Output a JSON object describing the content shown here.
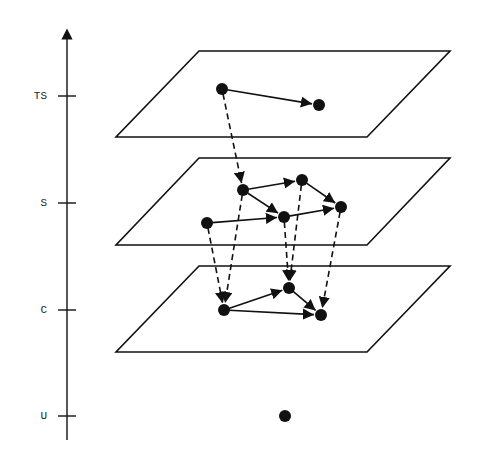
{
  "axis": {
    "x": 67,
    "top": 30,
    "bottom": 440,
    "levels": [
      {
        "id": "TS",
        "label": "TS",
        "y": 96
      },
      {
        "id": "S",
        "label": "S",
        "y": 203
      },
      {
        "id": "C",
        "label": "C",
        "y": 310
      },
      {
        "id": "U",
        "label": "U",
        "y": 416
      }
    ]
  },
  "planes": [
    {
      "id": "TS",
      "top_y": 51,
      "bottom_y": 137,
      "top_x1": 199,
      "top_x2": 450,
      "bottom_x1": 116,
      "bottom_x2": 367
    },
    {
      "id": "S",
      "top_y": 158,
      "bottom_y": 245,
      "top_x1": 199,
      "top_x2": 450,
      "bottom_x1": 116,
      "bottom_x2": 367
    },
    {
      "id": "C",
      "top_y": 266,
      "bottom_y": 352,
      "top_x1": 199,
      "top_x2": 450,
      "bottom_x1": 116,
      "bottom_x2": 367
    }
  ],
  "nodes": [
    {
      "id": "ts1",
      "level": "TS",
      "x": 222,
      "y": 89
    },
    {
      "id": "ts2",
      "level": "TS",
      "x": 319,
      "y": 105
    },
    {
      "id": "s1",
      "level": "S",
      "x": 243,
      "y": 190
    },
    {
      "id": "s2",
      "level": "S",
      "x": 302,
      "y": 180
    },
    {
      "id": "s3",
      "level": "S",
      "x": 341,
      "y": 207
    },
    {
      "id": "s4",
      "level": "S",
      "x": 284,
      "y": 217
    },
    {
      "id": "s5",
      "level": "S",
      "x": 207,
      "y": 223
    },
    {
      "id": "c1",
      "level": "C",
      "x": 224,
      "y": 310
    },
    {
      "id": "c2",
      "level": "C",
      "x": 289,
      "y": 288
    },
    {
      "id": "c3",
      "level": "C",
      "x": 321,
      "y": 315
    },
    {
      "id": "u1",
      "level": "U",
      "x": 285,
      "y": 416
    }
  ],
  "edges": [
    {
      "from": "ts1",
      "to": "ts2",
      "style": "solid"
    },
    {
      "from": "s1",
      "to": "s2",
      "style": "solid"
    },
    {
      "from": "s2",
      "to": "s3",
      "style": "solid"
    },
    {
      "from": "s1",
      "to": "s4",
      "style": "solid"
    },
    {
      "from": "s5",
      "to": "s4",
      "style": "solid"
    },
    {
      "from": "s4",
      "to": "s3",
      "style": "solid"
    },
    {
      "from": "c1",
      "to": "c2",
      "style": "solid"
    },
    {
      "from": "c2",
      "to": "c3",
      "style": "solid"
    },
    {
      "from": "c1",
      "to": "c3",
      "style": "solid"
    },
    {
      "from": "ts1",
      "to": "s1",
      "style": "dashed"
    },
    {
      "from": "s5",
      "to": "c1",
      "style": "dashed"
    },
    {
      "from": "s1",
      "to": "c1",
      "style": "dashed"
    },
    {
      "from": "s4",
      "to": "c2",
      "style": "dashed"
    },
    {
      "from": "s2",
      "to": "c2",
      "style": "dashed"
    },
    {
      "from": "s3",
      "to": "c3",
      "style": "dashed"
    }
  ],
  "colors": {
    "ink": "#111111",
    "background": "#ffffff"
  }
}
